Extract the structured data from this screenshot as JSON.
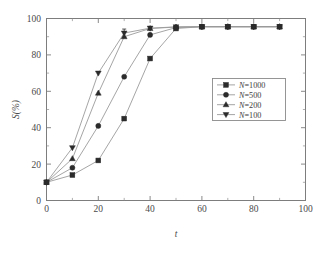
{
  "chart_data": {
    "type": "line",
    "title": "",
    "xlabel": "t",
    "ylabel": "S(%)",
    "xlim": [
      0,
      100
    ],
    "ylim": [
      0,
      100
    ],
    "xticks": [
      0,
      20,
      40,
      60,
      80,
      100
    ],
    "yticks": [
      0,
      20,
      40,
      60,
      80,
      100
    ],
    "xtick_labels": [
      "0",
      "20",
      "40",
      "60",
      "80",
      "100"
    ],
    "ytick_labels": [
      "0",
      "20",
      "40",
      "60",
      "80",
      "100"
    ],
    "xminor_step": 10,
    "yminor_step": 10,
    "grid": false,
    "legend_position": "center-right",
    "x": [
      0,
      10,
      20,
      30,
      40,
      50,
      60,
      70,
      80,
      90
    ],
    "series": [
      {
        "name": "N=1000",
        "marker": "square",
        "values": [
          10,
          14,
          22,
          45,
          78,
          94.5,
          95.5,
          95.5,
          95.5,
          95.5
        ]
      },
      {
        "name": "N=500",
        "marker": "circle",
        "values": [
          10,
          18,
          41,
          68,
          91,
          95,
          95.5,
          95.5,
          95.5,
          95.5
        ]
      },
      {
        "name": "N=200",
        "marker": "triangle-up",
        "values": [
          10,
          23,
          59,
          90,
          94.5,
          95.3,
          95.5,
          95.5,
          95.5,
          95.5
        ]
      },
      {
        "name": "N=100",
        "marker": "triangle-down",
        "values": [
          10,
          29,
          70,
          92,
          94.7,
          95.4,
          95.5,
          95.5,
          95.5,
          95.5
        ]
      }
    ],
    "error_bars": [
      {
        "series": "N=100",
        "x": 30,
        "y": 92,
        "err": 2.2
      }
    ],
    "colors": {
      "line": "#9b9b9b",
      "marker": "#2b2b2b",
      "frame": "#7d7d7d",
      "background": "#ffffff"
    }
  },
  "legend": {
    "entries": [
      {
        "label_var": "N",
        "label_eq": "=1000",
        "full": "N=1000",
        "marker": "square"
      },
      {
        "label_var": "N",
        "label_eq": "=500",
        "full": "N=500",
        "marker": "circle"
      },
      {
        "label_var": "N",
        "label_eq": "=200",
        "full": "N=200",
        "marker": "triangle-up"
      },
      {
        "label_var": "N",
        "label_eq": "=100",
        "full": "N=100",
        "marker": "triangle-down"
      }
    ]
  },
  "axes": {
    "x_title": "t",
    "y_title": "S(%)"
  }
}
